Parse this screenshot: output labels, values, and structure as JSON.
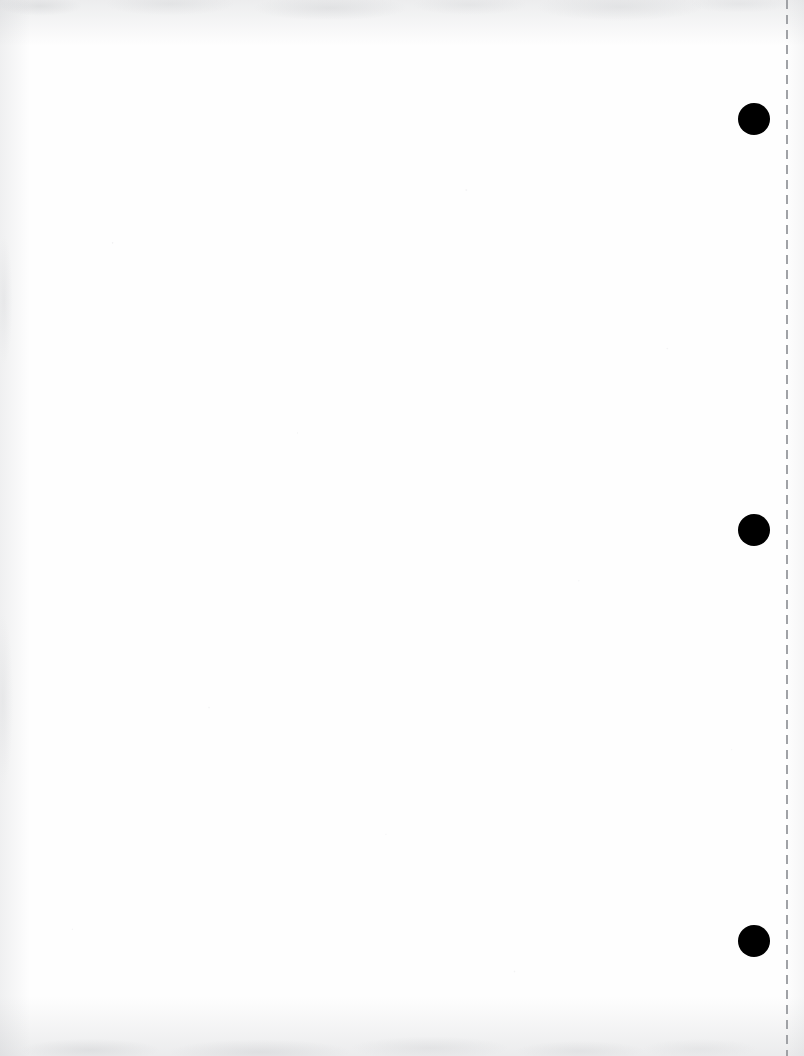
{
  "document": {
    "kind": "scanned-page",
    "title": "Blank scanned page",
    "page_width": 804,
    "page_height": 1056,
    "background_color": "#fefefe",
    "body_text": "",
    "body_note": "Blank page — no printed text, headings, figures or captions are visible.",
    "orientation": "portrait"
  },
  "perforation": {
    "label": "Tear-off perforation line",
    "orientation": "vertical",
    "x": 786,
    "top": 0,
    "height": 1056,
    "color": "#a0a2a6",
    "thickness": 2,
    "dash_length": 9,
    "gap_length": 6,
    "style": "dashed"
  },
  "punch_holes": {
    "label": "Binder punch holes",
    "count": 3,
    "color": "#000000",
    "radius": 16,
    "center_x": 754,
    "items": [
      {
        "name": "punch-hole-top",
        "cx": 754,
        "cy": 119,
        "r": 16,
        "color": "#000000"
      },
      {
        "name": "punch-hole-middle",
        "cx": 754,
        "cy": 530,
        "r": 16,
        "color": "#000000"
      },
      {
        "name": "punch-hole-bottom",
        "cx": 754,
        "cy": 941,
        "r": 16,
        "color": "#000000"
      }
    ]
  },
  "scan_artifacts": {
    "label": "Scanner edge shading and paper grain",
    "edges": [
      "top",
      "bottom",
      "left",
      "right"
    ],
    "tint_color": "#aaacb0"
  }
}
